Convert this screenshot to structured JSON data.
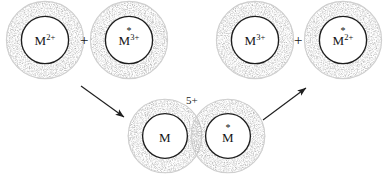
{
  "diagram": {
    "ink_color": "#1a1a1a",
    "shell_color": "#8a8a8a",
    "background": "#ffffff"
  },
  "reactants": {
    "species": [
      {
        "id": "m2plus",
        "symbol": "M",
        "charge": "2+",
        "labeled": false,
        "star": ""
      },
      {
        "id": "m3plus-star",
        "symbol": "M",
        "charge": "3+",
        "labeled": true,
        "star": "*"
      }
    ],
    "operator": "+"
  },
  "products": {
    "species": [
      {
        "id": "m3plus",
        "symbol": "M",
        "charge": "3+",
        "labeled": false,
        "star": ""
      },
      {
        "id": "m2plus-star",
        "symbol": "M",
        "charge": "2+",
        "labeled": true,
        "star": "*"
      }
    ],
    "operator": "+"
  },
  "intermediate": {
    "charge_label": "5+",
    "species": [
      {
        "id": "m-bridge",
        "symbol": "M",
        "charge": "",
        "labeled": false,
        "star": ""
      },
      {
        "id": "m-bridge-star",
        "symbol": "M",
        "charge": "",
        "labeled": true,
        "star": "*"
      }
    ]
  },
  "arrows": [
    {
      "id": "forward-arrow",
      "direction": "down-right",
      "from": "reactants",
      "to": "intermediate"
    },
    {
      "id": "dissociation-arrow",
      "direction": "up-right",
      "from": "intermediate",
      "to": "products"
    }
  ]
}
